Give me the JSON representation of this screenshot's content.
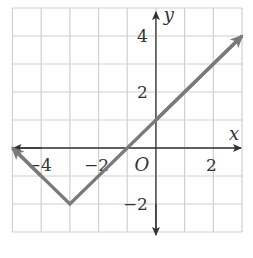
{
  "chart_data": {
    "type": "line",
    "title": "",
    "xlabel": "x",
    "ylabel": "y",
    "origin_label": "O",
    "xlim": [
      -5,
      3
    ],
    "ylim": [
      -3,
      5
    ],
    "grid": true,
    "grid_step": 1,
    "x_ticks": [
      {
        "value": -4,
        "label": "−4"
      },
      {
        "value": -2,
        "label": "−2"
      },
      {
        "value": 2,
        "label": "2"
      }
    ],
    "y_ticks": [
      {
        "value": 4,
        "label": "4"
      },
      {
        "value": 2,
        "label": "2"
      },
      {
        "value": -2,
        "label": "−2"
      }
    ],
    "series": [
      {
        "name": "y = |x + 3| − 2",
        "points": [
          [
            -5,
            0
          ],
          [
            -3,
            -2
          ],
          [
            3,
            4
          ]
        ],
        "arrows": [
          "start",
          "end"
        ],
        "color": "#7a7a7a"
      }
    ],
    "colors": {
      "grid": "#cfcfcf",
      "axis": "#333333",
      "line": "#7a7a7a"
    }
  }
}
